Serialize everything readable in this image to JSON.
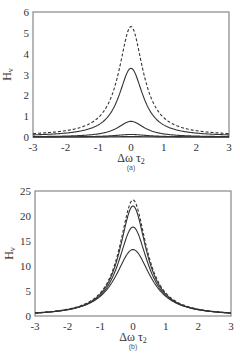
{
  "chart_data": [
    {
      "type": "line",
      "panel_label": "(a)",
      "xlabel": "Δω τ2",
      "ylabel": "Hv",
      "xlim": [
        -3,
        3
      ],
      "ylim": [
        0,
        6
      ],
      "xticks": [
        "-3",
        "-2",
        "-1",
        "0",
        "1",
        "2",
        "3"
      ],
      "yticks": [
        "0",
        "1",
        "2",
        "3",
        "4",
        "5",
        "6"
      ],
      "grid": false,
      "legend": "none",
      "series": [
        {
          "name": "dashed",
          "style": "dashed",
          "peak": 5.3,
          "width": 0.45,
          "base": 0.05
        },
        {
          "name": "solid-1",
          "style": "solid",
          "peak": 3.3,
          "width": 0.45,
          "base": 0.03
        },
        {
          "name": "solid-2",
          "style": "solid",
          "peak": 0.75,
          "width": 0.5,
          "base": 0.0
        },
        {
          "name": "solid-3",
          "style": "solid",
          "peak": 0.12,
          "width": 0.6,
          "base": 0.0
        },
        {
          "name": "solid-4",
          "style": "solid",
          "peak": 0.02,
          "width": 0.6,
          "base": 0.0
        }
      ]
    },
    {
      "type": "line",
      "panel_label": "(b)",
      "xlabel": "Δω τ2",
      "ylabel": "Hv",
      "xlim": [
        -3,
        3
      ],
      "ylim": [
        0,
        25
      ],
      "xticks": [
        "-3",
        "-2",
        "-1",
        "0",
        "1",
        "2",
        "3"
      ],
      "yticks": [
        "0",
        "5",
        "10",
        "15",
        "20",
        "25"
      ],
      "grid": false,
      "legend": "none",
      "series": [
        {
          "name": "dashed",
          "style": "dashed",
          "peak": 23.2,
          "width": 0.5
        },
        {
          "name": "solid-1",
          "style": "solid",
          "peak": 22.0,
          "width": 0.5
        },
        {
          "name": "solid-2",
          "style": "solid",
          "peak": 17.8,
          "width": 0.55
        },
        {
          "name": "solid-3",
          "style": "solid",
          "peak": 13.3,
          "width": 0.65
        }
      ]
    }
  ],
  "panels": {
    "a": {
      "caption": "(a)",
      "ylabel_main": "H",
      "ylabel_sub": "v",
      "xlabel_main": "Δω τ",
      "xlabel_sub": "2"
    },
    "b": {
      "caption": "(b)",
      "ylabel_main": "H",
      "ylabel_sub": "v",
      "xlabel_main": "Δω τ",
      "xlabel_sub": "2"
    }
  }
}
